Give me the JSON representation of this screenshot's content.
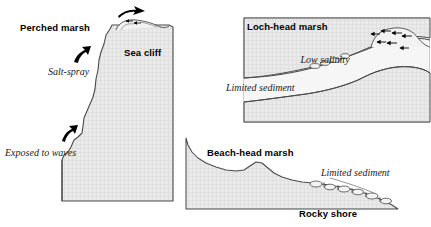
{
  "figure": {
    "background_color": "#ffffff",
    "land_fill_color": "#e8e8e8",
    "outline_color": "#3a3a3a",
    "panel_border_color": "#cfcfcf"
  },
  "panels": [
    {
      "id": "perched-marsh",
      "labels": {
        "title": "Perched marsh",
        "feature": "Sea cliff",
        "process_1": "Salt-spray",
        "process_2": "Exposed to waves"
      },
      "icons": [
        {
          "name": "spray-arrow-up-right-icon",
          "meaning": "salt spray carried upward"
        },
        {
          "name": "wave-arrow-up-icon",
          "meaning": "wave attack at cliff base"
        },
        {
          "name": "spray-arrow-over-cliff-icon",
          "meaning": "spray crossing cliff top"
        },
        {
          "name": "marsh-vegetation-tuft-icon",
          "meaning": "perched marsh vegetation on cliff top"
        }
      ]
    },
    {
      "id": "loch-head-marsh",
      "labels": {
        "title": "Loch-head marsh",
        "process_1": "Low salinity",
        "process_2": "Limited sediment"
      },
      "icons": [
        {
          "name": "freshwater-down-arrows-icon",
          "meaning": "freshwater input from catchment"
        },
        {
          "name": "marsh-vegetation-tuft-icon",
          "meaning": "marsh surface vegetation"
        }
      ]
    },
    {
      "id": "beach-head-marsh",
      "labels": {
        "title": "Beach-head marsh",
        "process_1": "Limited sediment",
        "process_2": "Rocky shore"
      },
      "icons": [
        {
          "name": "rocky-shore-boulders-icon",
          "meaning": "boulders and cobbles of rocky shore"
        },
        {
          "name": "marsh-vegetation-tuft-icon",
          "meaning": "marsh surface vegetation"
        }
      ]
    }
  ]
}
